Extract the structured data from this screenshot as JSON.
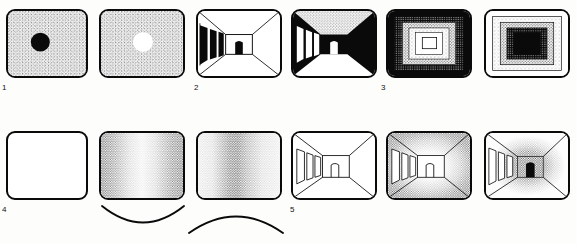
{
  "figure": {
    "rows": 2,
    "columns": 6,
    "ink_color": "#0a0a0a",
    "paper_color": "#ffffff",
    "stipple_color": "#1a1a1a"
  },
  "labels": [
    {
      "id": "label-1",
      "text": "1",
      "x": 2,
      "y": 84
    },
    {
      "id": "label-2",
      "text": "2",
      "x": 194,
      "y": 84
    },
    {
      "id": "label-3",
      "text": "3",
      "x": 381,
      "y": 84
    },
    {
      "id": "label-4",
      "text": "4",
      "x": 2,
      "y": 206
    },
    {
      "id": "label-5",
      "text": "5",
      "x": 290,
      "y": 206
    }
  ],
  "panels": [
    {
      "id": "panel-1a",
      "name": "dark-disc-on-stipple",
      "row": 1,
      "col": 1,
      "x": 6,
      "y": 9,
      "w": 82,
      "h": 69,
      "kind": "disc",
      "field": "stipple",
      "disc": {
        "fill": "#0a0a0a",
        "cx": 34,
        "cy": 33,
        "r": 10
      },
      "caption": "Dark disc on light stippled field"
    },
    {
      "id": "panel-1b",
      "name": "light-disc-on-stipple",
      "row": 1,
      "col": 2,
      "x": 99,
      "y": 9,
      "w": 86,
      "h": 69,
      "kind": "disc",
      "field": "stipple",
      "disc": {
        "fill": "#ffffff",
        "cx": 44,
        "cy": 33,
        "r": 10
      },
      "caption": "Light disc on light stippled field"
    },
    {
      "id": "panel-2a",
      "name": "corridor-outline",
      "row": 1,
      "col": 3,
      "x": 196,
      "y": 9,
      "w": 86,
      "h": 69,
      "kind": "corridor",
      "style": "outline-dark-doors",
      "doors_left": 4,
      "far_door": {
        "fill": "#0a0a0a"
      },
      "caption": "Corridor in linear perspective, outline with black side doorways"
    },
    {
      "id": "panel-2b",
      "name": "corridor-inverted",
      "row": 1,
      "col": 4,
      "x": 291,
      "y": 9,
      "w": 86,
      "h": 69,
      "kind": "corridor",
      "style": "solid-black-walls",
      "doors_left": 3,
      "far_door": {
        "fill": "#ffffff"
      },
      "caption": "Corridor with solid black walls, stippled ceiling and white floor"
    },
    {
      "id": "panel-3a",
      "name": "concentric-dark-outside",
      "row": 1,
      "col": 5,
      "x": 386,
      "y": 9,
      "w": 86,
      "h": 69,
      "kind": "concentric",
      "order": "dark-to-light",
      "bands": 5,
      "caption": "Concentric rectangles, dark outside fading to white centre"
    },
    {
      "id": "panel-3b",
      "name": "concentric-light-outside",
      "row": 1,
      "col": 6,
      "x": 484,
      "y": 9,
      "w": 86,
      "h": 69,
      "kind": "concentric",
      "order": "light-to-dark",
      "bands": 5,
      "caption": "Concentric rectangles, white outside darkening to black centre"
    },
    {
      "id": "panel-4a",
      "name": "blank-panel",
      "row": 2,
      "col": 1,
      "x": 6,
      "y": 131,
      "w": 82,
      "h": 69,
      "kind": "blank",
      "caption": "Empty white panel"
    },
    {
      "id": "panel-4b",
      "name": "gradient-light-centre",
      "row": 2,
      "col": 2,
      "x": 99,
      "y": 131,
      "w": 86,
      "h": 69,
      "kind": "gradient",
      "direction": "horizontal",
      "profile": "dark-edges-light-centre",
      "arc": {
        "shape": "concave-up",
        "label": "smile-arc"
      },
      "caption": "Horizontal stipple gradient, dark at both edges, light centre"
    },
    {
      "id": "panel-4c",
      "name": "gradient-dark-centre",
      "row": 2,
      "col": 3,
      "x": 196,
      "y": 131,
      "w": 86,
      "h": 69,
      "kind": "gradient",
      "direction": "horizontal",
      "profile": "light-edges-dark-centre",
      "arc": {
        "shape": "concave-down",
        "label": "frown-arc"
      },
      "caption": "Horizontal stipple gradient, light at edges, dark band left of centre"
    },
    {
      "id": "panel-5a",
      "name": "corridor-plain-outline",
      "row": 2,
      "col": 4,
      "x": 291,
      "y": 131,
      "w": 86,
      "h": 69,
      "kind": "corridor",
      "style": "plain-outline",
      "doors_left": 3,
      "far_door": {
        "fill": "#ffffff"
      },
      "caption": "Corridor drawn in plain outline, no shading"
    },
    {
      "id": "panel-5b",
      "name": "corridor-dark-edges",
      "row": 2,
      "col": 5,
      "x": 386,
      "y": 131,
      "w": 86,
      "h": 69,
      "kind": "corridor",
      "style": "stipple-dark-edges",
      "doors_left": 3,
      "far_door": {
        "fill": "#ffffff"
      },
      "caption": "Corridor with stipple shading dark at the edges, light far wall"
    },
    {
      "id": "panel-5c",
      "name": "corridor-dark-end",
      "row": 2,
      "col": 6,
      "x": 484,
      "y": 131,
      "w": 86,
      "h": 69,
      "kind": "corridor",
      "style": "stipple-dark-end",
      "doors_left": 4,
      "far_door": {
        "fill": "#0a0a0a"
      },
      "caption": "Corridor with stipple shading light at the edges, dark far end with black doorway"
    }
  ],
  "arcs": [
    {
      "id": "arc-smile",
      "name": "smile-arc",
      "x": 100,
      "y": 203,
      "w": 86,
      "h": 34,
      "shape": "concave-up"
    },
    {
      "id": "arc-frown",
      "name": "frown-arc",
      "x": 188,
      "y": 200,
      "w": 96,
      "h": 34,
      "shape": "concave-down"
    }
  ]
}
